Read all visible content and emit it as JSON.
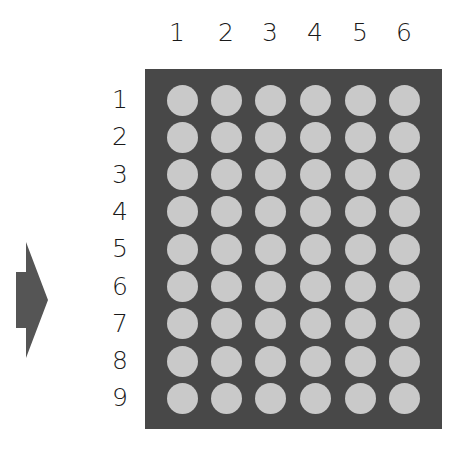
{
  "diagram": {
    "type": "dot-matrix",
    "columns": [
      "1",
      "2",
      "3",
      "4",
      "5",
      "6"
    ],
    "rows": [
      "1",
      "2",
      "3",
      "4",
      "5",
      "6",
      "7",
      "8",
      "9"
    ],
    "colors": {
      "matrix_background": "#484848",
      "dot": "#c9c9c9",
      "arrow": "#555555",
      "label_text": "#1a1a1a"
    },
    "arrow": {
      "direction": "right",
      "icon": "arrow-right-icon"
    }
  }
}
